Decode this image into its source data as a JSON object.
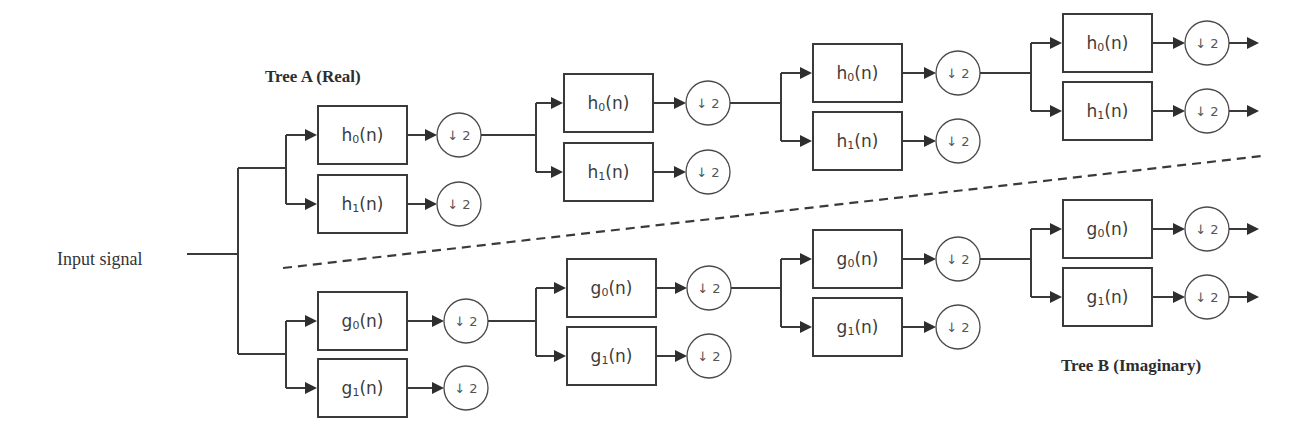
{
  "diagram": {
    "input_label": "Input signal",
    "tree_a_label": "Tree A (Real)",
    "tree_b_label": "Tree B (Imaginary)",
    "downsample_label": "↓ 2",
    "colors": {
      "line": "#3a3a3a",
      "text": "#3c3c3c",
      "background": "#ffffff"
    },
    "trees": [
      {
        "name": "tree-a",
        "filter_prefix": "h",
        "stages": [
          {
            "x": 318,
            "jx": 286,
            "feed_y": 168,
            "boxes": [
              {
                "label": "h",
                "sub": "0",
                "y": 106
              },
              {
                "label": "h",
                "sub": "1",
                "y": 175
              }
            ],
            "cx": 459
          },
          {
            "x": 564,
            "jx": 536,
            "feed_y": 134,
            "boxes": [
              {
                "label": "h",
                "sub": "0",
                "y": 74
              },
              {
                "label": "h",
                "sub": "1",
                "y": 143
              }
            ],
            "cx": 708
          },
          {
            "x": 813,
            "jx": 781,
            "feed_y": 104,
            "boxes": [
              {
                "label": "h",
                "sub": "0",
                "y": 44
              },
              {
                "label": "h",
                "sub": "1",
                "y": 112
              }
            ],
            "cx": 958
          },
          {
            "x": 1063,
            "jx": 1031,
            "feed_y": 73,
            "boxes": [
              {
                "label": "h",
                "sub": "0",
                "y": 14
              },
              {
                "label": "h",
                "sub": "1",
                "y": 82
              }
            ],
            "cx": 1207,
            "outputs": true
          }
        ]
      },
      {
        "name": "tree-b",
        "filter_prefix": "g",
        "stages": [
          {
            "x": 318,
            "jx": 286,
            "feed_y": 354,
            "boxes": [
              {
                "label": "g",
                "sub": "0",
                "y": 292
              },
              {
                "label": "g",
                "sub": "1",
                "y": 359
              }
            ],
            "cx": 466
          },
          {
            "x": 567,
            "jx": 536,
            "feed_y": 321,
            "boxes": [
              {
                "label": "g",
                "sub": "0",
                "y": 259
              },
              {
                "label": "g",
                "sub": "1",
                "y": 327
              }
            ],
            "cx": 709
          },
          {
            "x": 813,
            "jx": 781,
            "feed_y": 288,
            "boxes": [
              {
                "label": "g",
                "sub": "0",
                "y": 230
              },
              {
                "label": "g",
                "sub": "1",
                "y": 298
              }
            ],
            "cx": 958
          },
          {
            "x": 1063,
            "jx": 1031,
            "feed_y": 259,
            "boxes": [
              {
                "label": "g",
                "sub": "0",
                "y": 200
              },
              {
                "label": "g",
                "sub": "1",
                "y": 268
              }
            ],
            "cx": 1207,
            "outputs": true
          }
        ]
      }
    ]
  }
}
